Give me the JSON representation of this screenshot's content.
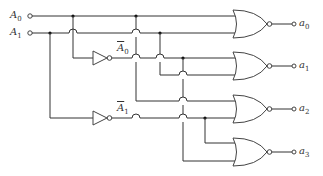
{
  "diagram": {
    "type": "2-to-4 decoder (NOR gate implementation)",
    "inputs": [
      {
        "name": "A",
        "sub": "0"
      },
      {
        "name": "A",
        "sub": "1"
      }
    ],
    "inverted_labels": [
      {
        "name": "A",
        "sub": "0"
      },
      {
        "name": "A",
        "sub": "1"
      }
    ],
    "outputs": [
      {
        "name": "a",
        "sub": "0"
      },
      {
        "name": "a",
        "sub": "1"
      },
      {
        "name": "a",
        "sub": "2"
      },
      {
        "name": "a",
        "sub": "3"
      }
    ],
    "gates": [
      "NOT",
      "NOT",
      "NOR",
      "NOR",
      "NOR",
      "NOR"
    ],
    "line_color": "#333333"
  }
}
